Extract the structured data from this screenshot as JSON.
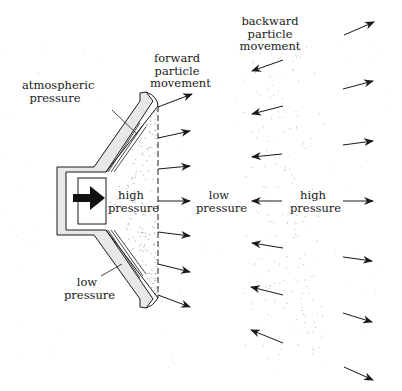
{
  "diagram": {
    "colors": {
      "background": "#ffffff",
      "ink": "#1a1a1a",
      "speaker_fill": "#e8e8e8",
      "dots": "#9a9a9a"
    },
    "labels": {
      "atmospheric_pressure": "atmospheric\npressure",
      "forward_particle_movement": "forward\nparticle\nmovement",
      "backward_particle_movement": "backward\nparticle\nmovement",
      "high_pressure_cone": "high\npressure",
      "low_pressure_middle": "low\npressure",
      "high_pressure_right": "high\npressure",
      "low_pressure_speaker": "low\npressure"
    },
    "components": [
      {
        "name": "speaker-cone",
        "description": "cone-shaped loudspeaker drawn in cross-section"
      },
      {
        "name": "magnet-driver",
        "description": "rectangular driver with bold right-pointing arrow"
      },
      {
        "name": "cone-front-dashed-line",
        "description": "dashed vertical line at cone opening"
      }
    ],
    "arrow_columns": [
      {
        "name": "forward-arrows",
        "direction": "outward-right",
        "count": 7
      },
      {
        "name": "backward-arrows",
        "direction": "inward-left",
        "count": 7
      },
      {
        "name": "far-right-arrows",
        "direction": "outward-right",
        "count": 7
      }
    ]
  }
}
